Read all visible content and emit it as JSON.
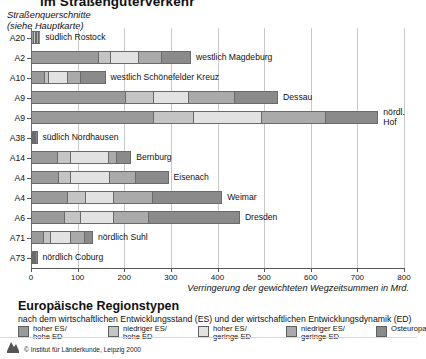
{
  "title": "im Straßengüterverkehr",
  "subtitle_line1": "Straßenquerschnitte",
  "subtitle_line2": "(siehe Hauptkarte)",
  "axis_caption": "Verringerung der gewichteten Wegzeitsummen in Mrd.",
  "credit": "© Institut für Länderkunde, Leipzig 2000",
  "legend": {
    "title": "Europäische Regionstypen",
    "subtitle": "nach dem wirtschaftlichen Entwicklungsstand (ES) und der wirtschaftlichen Entwicklungsdynamik (ED)",
    "items": [
      {
        "label_line1": "hoher ES/",
        "label_line2": "hohe ED",
        "color": "#9a9a9a"
      },
      {
        "label_line1": "niedriger ES/",
        "label_line2": "hohe ED",
        "color": "#c4c4c4"
      },
      {
        "label_line1": "hoher ES/",
        "label_line2": "geringe ED",
        "color": "#e2e2e2"
      },
      {
        "label_line1": "niedriger ES/",
        "label_line2": "geringe ED",
        "color": "#aaaaaa"
      },
      {
        "label_line1": "Osteuropa",
        "label_line2": "",
        "color": "#8a8a8a"
      }
    ]
  },
  "chart_data": {
    "type": "bar",
    "orientation": "horizontal",
    "stacked": true,
    "title": "im Straßengüterverkehr",
    "xlabel": "Verringerung der gewichteten Wegzeitsummen in Mrd.",
    "ylabel": "Straßenquerschnitte (siehe Hauptkarte)",
    "xlim": [
      0,
      800
    ],
    "xticks": [
      0,
      100,
      200,
      300,
      400,
      500,
      600,
      700,
      800
    ],
    "grid": true,
    "legend_position": "below",
    "series": [
      {
        "name": "hoher ES/hohe ED",
        "color": "#9a9a9a"
      },
      {
        "name": "niedriger ES/hohe ED",
        "color": "#c4c4c4"
      },
      {
        "name": "hoher ES/geringe ED",
        "color": "#e2e2e2"
      },
      {
        "name": "niedriger ES/geringe ED",
        "color": "#aaaaaa"
      },
      {
        "name": "Osteuropa",
        "color": "#8a8a8a"
      }
    ],
    "categories": [
      "A20",
      "A2",
      "A10",
      "A9",
      "A9",
      "A38",
      "A14",
      "A4",
      "A4",
      "A6",
      "A71",
      "A73"
    ],
    "rows": [
      {
        "category": "A20",
        "label": "südlich Rostock",
        "label_lines": 1,
        "total": 20,
        "values": [
          6,
          4,
          4,
          3,
          3
        ]
      },
      {
        "category": "A2",
        "label": "westlich Magdeburg",
        "label_lines": 1,
        "total": 343,
        "values": [
          146,
          26,
          60,
          49,
          62
        ]
      },
      {
        "category": "A10",
        "label": "westlich Schönefelder Kreuz",
        "label_lines": 1,
        "total": 160,
        "values": [
          28,
          8,
          40,
          30,
          54
        ]
      },
      {
        "category": "A9",
        "label": "Dessau",
        "label_lines": 1,
        "total": 530,
        "values": [
          205,
          59,
          75,
          98,
          93
        ]
      },
      {
        "category": "A9",
        "label": "nördl. Hof",
        "label_lines": 2,
        "total": 745,
        "values": [
          265,
          85,
          146,
          138,
          111
        ]
      },
      {
        "category": "A38",
        "label": "südlich Nordhausen",
        "label_lines": 1,
        "total": 14,
        "values": [
          5,
          3,
          2,
          2,
          2
        ]
      },
      {
        "category": "A14",
        "label": "Bernburg",
        "label_lines": 1,
        "total": 215,
        "values": [
          58,
          26,
          85,
          16,
          30
        ]
      },
      {
        "category": "A4",
        "label": "Eisenach",
        "label_lines": 1,
        "total": 295,
        "values": [
          58,
          26,
          85,
          56,
          70
        ]
      },
      {
        "category": "A4",
        "label": "Weimar",
        "label_lines": 1,
        "total": 410,
        "values": [
          78,
          38,
          60,
          84,
          150
        ]
      },
      {
        "category": "A6",
        "label": "Dresden",
        "label_lines": 1,
        "total": 448,
        "values": [
          70,
          33,
          72,
          75,
          198
        ]
      },
      {
        "category": "A71",
        "label": "nördlich Suhl",
        "label_lines": 1,
        "total": 133,
        "values": [
          27,
          13,
          45,
          32,
          16
        ]
      },
      {
        "category": "A73",
        "label": "nördlich Coburg",
        "label_lines": 1,
        "total": 14,
        "values": [
          5,
          3,
          2,
          2,
          2
        ]
      }
    ]
  }
}
